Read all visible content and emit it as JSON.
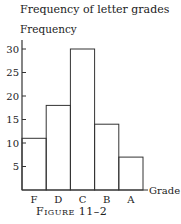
{
  "chart_data": {
    "type": "bar",
    "title": "Frequency of letter grades",
    "ylabel": "Frequency",
    "xlabel": "Grade",
    "categories": [
      "F",
      "D",
      "C",
      "B",
      "A"
    ],
    "values": [
      11,
      18,
      30,
      14,
      7
    ],
    "ylim": [
      0,
      32
    ],
    "yticks": [
      5,
      10,
      15,
      20,
      25,
      30
    ],
    "grid": false,
    "caption": "Figure 11–2"
  }
}
